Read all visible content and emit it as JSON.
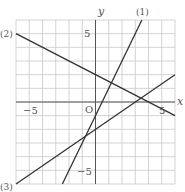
{
  "chart_data": {
    "type": "line",
    "title": "",
    "xlabel": "x",
    "ylabel": "y",
    "origin_label": "O",
    "xlim": [
      -6,
      6
    ],
    "ylim": [
      -6,
      6
    ],
    "grid": true,
    "grid_step": 1,
    "tick_labels": {
      "x": [
        {
          "value": -5,
          "label": "−5"
        },
        {
          "value": 5,
          "label": "5"
        }
      ],
      "y": [
        {
          "value": 5,
          "label": "5"
        },
        {
          "value": -5,
          "label": "−5"
        }
      ]
    },
    "series": [
      {
        "name": "(1)",
        "equation": "y = 2x - 1",
        "x": [
          -2.5,
          3.5
        ],
        "y": [
          -6,
          6
        ]
      },
      {
        "name": "(2)",
        "equation": "y = -x/2 + 2",
        "x": [
          -6,
          6
        ],
        "y": [
          5,
          -1
        ]
      },
      {
        "name": "(3)",
        "equation": "y = 2x/3 - 2",
        "x": [
          -6,
          6
        ],
        "y": [
          -6,
          2
        ]
      }
    ]
  },
  "labels": {
    "x_axis": "x",
    "y_axis": "y",
    "origin": "O",
    "tick_x_neg5": "−5",
    "tick_x_5": "5",
    "tick_y_5": "5",
    "tick_y_neg5": "−5",
    "line1": "(1)",
    "line2": "(2)",
    "line3": "(3)"
  }
}
